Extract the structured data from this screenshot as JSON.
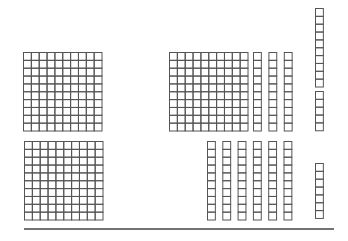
{
  "diagram": {
    "type": "base-ten-blocks",
    "colors": {
      "stroke": "#555555",
      "baseline": "#444444",
      "background": "#ffffff"
    },
    "groups": [
      {
        "name": "left-top-hundred-flat",
        "kind": "hundred",
        "count": 1
      },
      {
        "name": "left-bottom-hundred-flat",
        "kind": "hundred",
        "count": 1
      },
      {
        "name": "right-top-hundred-flat",
        "kind": "hundred",
        "count": 1
      },
      {
        "name": "right-top-ten-rods",
        "kind": "ten",
        "count": 3
      },
      {
        "name": "right-bottom-ten-rods",
        "kind": "ten",
        "count": 6
      },
      {
        "name": "far-right-ten-rod",
        "kind": "ten",
        "count": 1
      },
      {
        "name": "far-right-top-units",
        "kind": "unit",
        "count": 5
      },
      {
        "name": "far-right-bottom-units",
        "kind": "unit",
        "count": 7
      }
    ],
    "totals": {
      "left_value": 200,
      "right_hundreds": 1,
      "right_tens": 10,
      "right_units": 12
    }
  }
}
